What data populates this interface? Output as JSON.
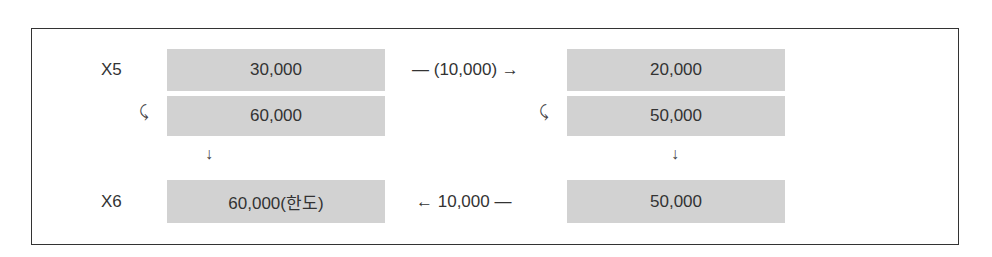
{
  "diagram": {
    "rows": {
      "x5": {
        "label": "X5"
      },
      "x6": {
        "label": "X6"
      }
    },
    "left": {
      "top": "30,000",
      "second": "60,000",
      "bottom": "60,000(한도)"
    },
    "right": {
      "top": "20,000",
      "second": "50,000",
      "bottom": "50,000"
    },
    "flows": {
      "top": "— (10,000) →",
      "bottom": "← 10,000 —"
    },
    "marks": {
      "curl": "⤹",
      "down": "↓"
    }
  }
}
